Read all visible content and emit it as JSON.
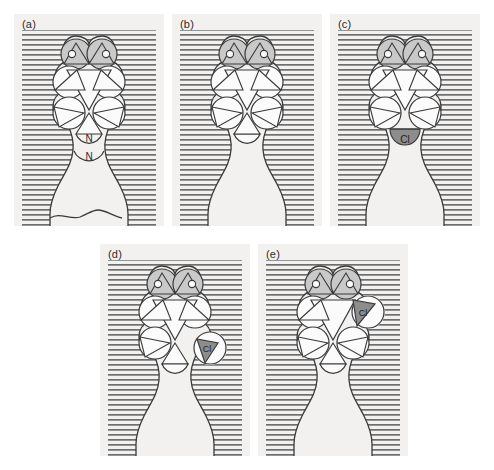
{
  "figure": {
    "background_color": "#ffffff",
    "panel_bg_color": "#f2f1f0",
    "hatch_color": "#6e6e6e",
    "outline_color": "#3a3a3a",
    "lobe_fill_white": "#fbfbfb",
    "lobe_fill_light": "#c9c9c9",
    "lobe_fill_dark": "#8d8d8d",
    "text_color": "#2b2b2b"
  },
  "panels": [
    {
      "id": "a",
      "label": "(a)",
      "oxygen_labels": [
        "o",
        "o"
      ],
      "bottom_labels": [
        "N",
        "N"
      ],
      "chlorine_label": "",
      "chlorine_position": "none",
      "has_bottom_arcs": true,
      "has_bottom_lobe": false
    },
    {
      "id": "b",
      "label": "(b)",
      "oxygen_labels": [
        "o",
        "o"
      ],
      "bottom_labels": [],
      "chlorine_label": "",
      "chlorine_position": "none",
      "has_bottom_arcs": false,
      "has_bottom_lobe": true
    },
    {
      "id": "c",
      "label": "(c)",
      "oxygen_labels": [
        "o",
        "o"
      ],
      "bottom_labels": [],
      "chlorine_label": "Cl",
      "chlorine_position": "bottom",
      "has_bottom_arcs": false,
      "has_bottom_lobe": true
    },
    {
      "id": "d",
      "label": "(d)",
      "oxygen_labels": [
        "o",
        "o"
      ],
      "bottom_labels": [],
      "chlorine_label": "Cl",
      "chlorine_position": "lower-right",
      "has_bottom_arcs": false,
      "has_bottom_lobe": true
    },
    {
      "id": "e",
      "label": "(e)",
      "oxygen_labels": [
        "o",
        "o"
      ],
      "bottom_labels": [],
      "chlorine_label": "Cl",
      "chlorine_position": "upper-right",
      "has_bottom_arcs": false,
      "has_bottom_lobe": true
    }
  ]
}
